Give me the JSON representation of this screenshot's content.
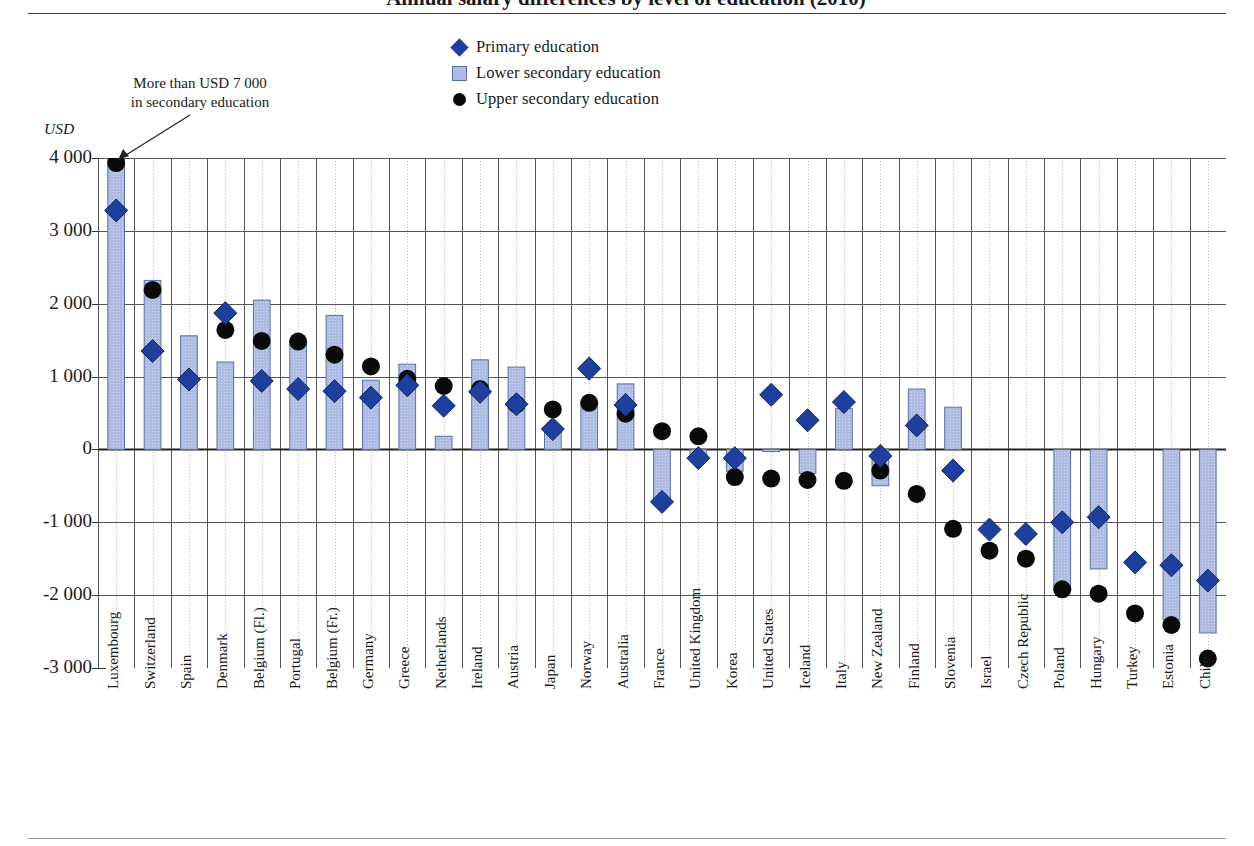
{
  "title": "Annual salary differences by level of education (2010)",
  "axis_unit": "USD",
  "annotation": {
    "line1": "More than USD 7 000",
    "line2": "in secondary education",
    "target_country": "Luxembourg"
  },
  "legend": {
    "position": "top-center",
    "items": [
      {
        "label": "Primary education",
        "marker": "diamond-icon",
        "color": "#1f3f9e"
      },
      {
        "label": "Lower secondary education",
        "marker": "square-icon",
        "color": "#aebce4"
      },
      {
        "label": "Upper secondary education",
        "marker": "circle-icon",
        "color": "#0a0a0a"
      }
    ]
  },
  "colors": {
    "primary": "#1f3f9e",
    "lower_secondary_fill": "#aebce4",
    "lower_secondary_edge": "#5a6ea8",
    "upper_secondary": "#0a0a0a",
    "gridline": "#555555",
    "minor_gridline": "#bbbbbb",
    "axis": "#333333"
  },
  "chart_data": {
    "type": "bar",
    "title": "Annual salary differences by level of education (2010)",
    "subtitle": "",
    "xlabel": "",
    "ylabel": "USD",
    "ylim": [
      -3000,
      4000
    ],
    "yticks": [
      4000,
      3000,
      2000,
      1000,
      0,
      -1000,
      -2000,
      -3000
    ],
    "ytick_labels": [
      "4 000",
      "3 000",
      "2 000",
      "1 000",
      "0",
      "-1 000",
      "-2 000",
      "-3 000"
    ],
    "grid": true,
    "legend_position": "top-center",
    "categories": [
      "Luxembourg",
      "Switzerland",
      "Spain",
      "Denmark",
      "Belgium (Fl.)",
      "Portugal",
      "Belgium (Fr.)",
      "Germany",
      "Greece",
      "Netherlands",
      "Ireland",
      "Austria",
      "Japan",
      "Norway",
      "Australia",
      "France",
      "United Kingdom",
      "Korea",
      "United States",
      "Iceland",
      "Italy",
      "New Zealand",
      "Finland",
      "Slovenia",
      "Israel",
      "Czech Republic",
      "Poland",
      "Hungary",
      "Turkey",
      "Estonia",
      "Chile"
    ],
    "series": [
      {
        "name": "Lower secondary education",
        "type": "bar",
        "values": [
          4000,
          2320,
          1560,
          1200,
          2050,
          1490,
          1840,
          950,
          1170,
          180,
          1230,
          1130,
          250,
          660,
          900,
          -730,
          -130,
          -300,
          -30,
          -330,
          560,
          -500,
          830,
          580,
          null,
          null,
          -1930,
          -1640,
          null,
          -2340,
          -2520
        ],
        "note_luxembourg": "value exceeds axis (more than USD 7 000)"
      },
      {
        "name": "Primary education",
        "type": "marker-diamond",
        "values": [
          3280,
          1350,
          960,
          1870,
          940,
          830,
          800,
          710,
          880,
          600,
          790,
          620,
          280,
          1110,
          610,
          -720,
          -120,
          -120,
          750,
          400,
          650,
          -90,
          330,
          -290,
          -1100,
          -1160,
          -1000,
          -930,
          -1550,
          -1590,
          -1800
        ]
      },
      {
        "name": "Upper secondary education",
        "type": "marker-circle",
        "values": [
          3930,
          2190,
          null,
          1640,
          1490,
          1480,
          1300,
          1140,
          970,
          870,
          830,
          620,
          550,
          640,
          490,
          250,
          180,
          -380,
          -400,
          -420,
          -430,
          -290,
          -610,
          -1090,
          -1390,
          -1500,
          -1920,
          -1980,
          -2250,
          -2410,
          -2870
        ]
      }
    ]
  }
}
